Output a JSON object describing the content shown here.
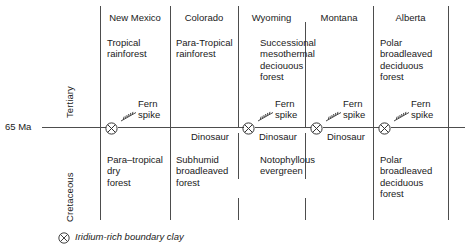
{
  "figure": {
    "type": "stratigraphic-timeline-diagram",
    "boundary_label": "65 Ma",
    "eras": {
      "upper": "Tertiary",
      "lower": "Cretaceous"
    },
    "legend": {
      "symbol": "iridium-marker-icon",
      "text": "Iridium-rich boundary clay"
    },
    "fern_spike_label_line1": "Fern",
    "fern_spike_label_line2": "spike",
    "dinosaur_label": "Dinosaur",
    "columns": [
      {
        "header": "New Mexico",
        "tertiary_flora": [
          "Tropical",
          "rainforest"
        ],
        "cretaceous_flora": [
          "Para–tropical",
          "dry",
          "forest"
        ],
        "has_fern_spike": true,
        "has_iridium_marker": true,
        "has_dinosaur_label": false
      },
      {
        "header": "Colorado",
        "tertiary_flora": [
          "Para-Tropical",
          "rainforest"
        ],
        "cretaceous_flora": [
          "Subhumid",
          "broadleaved",
          "forest"
        ],
        "has_fern_spike": false,
        "has_iridium_marker": false,
        "has_dinosaur_label": true
      },
      {
        "header": "Wyoming",
        "tertiary_flora": [
          "Successional",
          "mesothermal",
          "deciouous",
          "forest"
        ],
        "cretaceous_flora": [
          "Notophyllous",
          "evergreen"
        ],
        "has_fern_spike": true,
        "has_iridium_marker": true,
        "has_dinosaur_label": true
      },
      {
        "header": "Montana",
        "tertiary_flora": [],
        "cretaceous_flora": [],
        "has_fern_spike": true,
        "has_iridium_marker": true,
        "has_dinosaur_label": true
      },
      {
        "header": "Alberta",
        "tertiary_flora": [
          "Polar",
          "broadleaved",
          "deciduous",
          "forest"
        ],
        "cretaceous_flora": [
          "Polar",
          "broadleaved",
          "deciduous",
          "forest"
        ],
        "has_fern_spike": true,
        "has_iridium_marker": true,
        "has_dinosaur_label": false
      }
    ],
    "colors": {
      "rule": "#4d4d4d",
      "text": "#1a1a1a",
      "background": "#ffffff"
    }
  }
}
